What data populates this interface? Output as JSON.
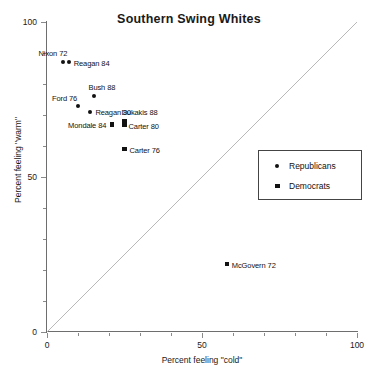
{
  "chart_data": {
    "type": "scatter",
    "title": "Southern Swing Whites",
    "xlabel": "Percent feeling \"cold\"",
    "ylabel": "Percent feeling \"warm\"",
    "xlim": [
      0,
      100
    ],
    "ylim": [
      0,
      100
    ],
    "xticks": [
      0,
      50,
      100
    ],
    "xticklabels": [
      "0",
      "50",
      "100"
    ],
    "yticks": [
      0,
      50,
      100
    ],
    "yticklabels": [
      "0",
      "50",
      "100"
    ],
    "minor_tick_step": 10,
    "grid": false,
    "reference_line": {
      "type": "diagonal",
      "from": [
        0,
        0
      ],
      "to": [
        100,
        100
      ],
      "color": "#b8b8b8"
    },
    "legend": {
      "position": "right-middle",
      "entries": [
        {
          "label": "Republicans",
          "marker": "circle"
        },
        {
          "label": "Democrats",
          "marker": "square"
        }
      ]
    },
    "series": [
      {
        "name": "Republicans",
        "marker": "circle",
        "color": "#121212",
        "points": [
          {
            "label": "Nixon 72",
            "x": 5,
            "y": 87,
            "label_dx": -24,
            "label_dy": -9
          },
          {
            "label": "Reagan 84",
            "x": 7,
            "y": 87,
            "label_dx": 5,
            "label_dy": 1
          },
          {
            "label": "Bush 88",
            "x": 15,
            "y": 76,
            "label_dx": -5,
            "label_dy": -9
          },
          {
            "label": "Ford 76",
            "x": 10,
            "y": 73,
            "label_dx": -26,
            "label_dy": -8
          },
          {
            "label": "Reagan 80",
            "x": 14,
            "y": 71,
            "label_dx": 5,
            "label_dy": 0
          }
        ]
      },
      {
        "name": "Democrats",
        "marker": "square",
        "color": "#121212",
        "points": [
          {
            "label": "Dukakis 88",
            "x": 25,
            "y": 68,
            "label_dx": -3,
            "label_dy": -9
          },
          {
            "label": "Carter 80",
            "x": 25,
            "y": 67,
            "label_dx": 4,
            "label_dy": 2
          },
          {
            "label": "Mondale 84",
            "x": 21,
            "y": 67,
            "label_dx": -44,
            "label_dy": 1
          },
          {
            "label": "Carter 76",
            "x": 25,
            "y": 59,
            "label_dx": 5,
            "label_dy": 1
          },
          {
            "label": "McGovern 72",
            "x": 58,
            "y": 22,
            "label_dx": 5,
            "label_dy": 1
          }
        ]
      }
    ]
  }
}
